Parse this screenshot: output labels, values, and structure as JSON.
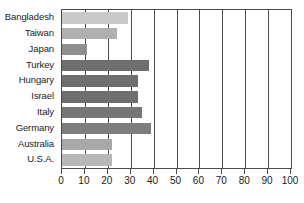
{
  "chart_data": {
    "type": "bar",
    "orientation": "horizontal",
    "title": "",
    "subtitle": "",
    "xlabel": "",
    "ylabel": "",
    "xlim": [
      0,
      100
    ],
    "xticks": [
      0,
      10,
      20,
      30,
      40,
      50,
      60,
      70,
      80,
      90,
      100
    ],
    "xtick_labels": [
      "0",
      "10",
      "20",
      "30",
      "40",
      "50",
      "60",
      "70",
      "80",
      "90",
      "100"
    ],
    "grid": true,
    "grid_axis": "x",
    "legend": false,
    "legend_position": "none",
    "categories": [
      "Bangladesh",
      "Taiwan",
      "Japan",
      "Turkey",
      "Hungary",
      "Israel",
      "Italy",
      "Germany",
      "Australia",
      "U.S.A."
    ],
    "values": [
      29,
      24,
      11,
      38,
      33,
      33,
      35,
      39,
      22,
      22
    ],
    "bar_colors": [
      "#c9c9c9",
      "#b0b0b0",
      "#8f8f8f",
      "#6e6e6e",
      "#6e6e6e",
      "#6e6e6e",
      "#767676",
      "#7d7d7d",
      "#a8a8a8",
      "#b8b8b8"
    ]
  },
  "axis": {
    "frame_color": "#4a4a4a",
    "gridline_color": "#4a4a4a",
    "label_color": "#1b1b1b"
  }
}
